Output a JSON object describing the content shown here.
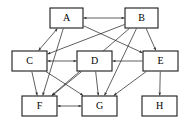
{
  "diagram": {
    "type": "directed-graph",
    "title": "",
    "canvas": {
      "width": 193,
      "height": 132,
      "background": "#ffffff"
    },
    "style": {
      "node_fill": "#ffffff",
      "node_stroke": "#1a1a1a",
      "edge_color": "#2b2b2b",
      "label_color": "#000000"
    },
    "nodes": [
      {
        "id": "A",
        "label": "A",
        "x": 50,
        "y": 8,
        "w": 33,
        "h": 20,
        "row": "top"
      },
      {
        "id": "B",
        "label": "B",
        "x": 125,
        "y": 8,
        "w": 33,
        "h": 20,
        "row": "top"
      },
      {
        "id": "C",
        "label": "C",
        "x": 12,
        "y": 51,
        "w": 35,
        "h": 20,
        "row": "middle"
      },
      {
        "id": "D",
        "label": "D",
        "x": 77,
        "y": 51,
        "w": 35,
        "h": 20,
        "row": "middle"
      },
      {
        "id": "E",
        "label": "E",
        "x": 143,
        "y": 51,
        "w": 35,
        "h": 20,
        "row": "middle"
      },
      {
        "id": "F",
        "label": "F",
        "x": 22,
        "y": 96,
        "w": 35,
        "h": 20,
        "row": "bottom"
      },
      {
        "id": "G",
        "label": "G",
        "x": 82,
        "y": 96,
        "w": 35,
        "h": 20,
        "row": "bottom"
      },
      {
        "id": "H",
        "label": "H",
        "x": 142,
        "y": 96,
        "w": 35,
        "h": 20,
        "row": "bottom"
      }
    ],
    "edges": [
      {
        "from": "A",
        "to": "B",
        "direction": "both"
      },
      {
        "from": "A",
        "to": "C",
        "direction": "both"
      },
      {
        "from": "A",
        "to": "E",
        "direction": "forward"
      },
      {
        "from": "A",
        "to": "F",
        "direction": "forward"
      },
      {
        "from": "B",
        "to": "C",
        "direction": "forward"
      },
      {
        "from": "B",
        "to": "E",
        "direction": "forward"
      },
      {
        "from": "B",
        "to": "F",
        "direction": "forward"
      },
      {
        "from": "B",
        "to": "G",
        "direction": "forward"
      },
      {
        "from": "C",
        "to": "D",
        "direction": "both"
      },
      {
        "from": "C",
        "to": "F",
        "direction": "forward"
      },
      {
        "from": "C",
        "to": "G",
        "direction": "forward"
      },
      {
        "from": "D",
        "to": "F",
        "direction": "forward"
      },
      {
        "from": "D",
        "to": "G",
        "direction": "forward"
      },
      {
        "from": "E",
        "to": "D",
        "direction": "forward"
      },
      {
        "from": "E",
        "to": "G",
        "direction": "forward"
      },
      {
        "from": "E",
        "to": "H",
        "direction": "forward"
      },
      {
        "from": "F",
        "to": "G",
        "direction": "both"
      }
    ]
  }
}
